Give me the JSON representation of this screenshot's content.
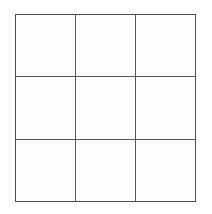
{
  "figure": {
    "name": "3x3-grid",
    "type": "grid",
    "title": "",
    "rows": 3,
    "columns": 3,
    "cell_count": 9,
    "cells": [
      {
        "row": 1,
        "col": 1,
        "label": ""
      },
      {
        "row": 1,
        "col": 2,
        "label": ""
      },
      {
        "row": 1,
        "col": 3,
        "label": ""
      },
      {
        "row": 2,
        "col": 1,
        "label": ""
      },
      {
        "row": 2,
        "col": 2,
        "label": ""
      },
      {
        "row": 2,
        "col": 3,
        "label": ""
      },
      {
        "row": 3,
        "col": 1,
        "label": ""
      },
      {
        "row": 3,
        "col": 2,
        "label": ""
      },
      {
        "row": 3,
        "col": 3,
        "label": ""
      }
    ],
    "geometry": {
      "left": 15,
      "top": 14,
      "width": 181,
      "height": 188,
      "column_widths": [
        61,
        60,
        60
      ],
      "row_heights": [
        63,
        63,
        62
      ],
      "vertical_divider_x": [
        76,
        136
      ],
      "horizontal_divider_y": [
        77,
        140
      ]
    },
    "colors": {
      "page_background": "#ffffff",
      "cell_fill": "#fefefe",
      "line": "#555555",
      "outline": "#4d4d4d"
    },
    "line_width_px": 1
  }
}
